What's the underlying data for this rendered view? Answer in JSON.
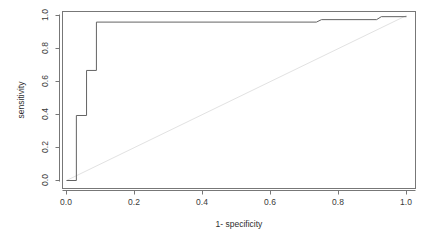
{
  "figure": {
    "kind": "roc-plot",
    "background_color": "#ffffff",
    "frame_color": "#777777",
    "curve_color": "#636363",
    "reference_line_color": "#e2e2e2",
    "tick_label_color": "#3a3a3a"
  },
  "chart_data": {
    "type": "line",
    "title": "",
    "xlabel": "1- specificity",
    "ylabel": "sensitivity",
    "xlim": [
      0.0,
      1.0
    ],
    "ylim": [
      0.0,
      1.0
    ],
    "grid": false,
    "legend": null,
    "xticks": [
      0.0,
      0.2,
      0.4,
      0.6,
      0.8,
      1.0
    ],
    "xtick_labels": [
      "0.0",
      "0.2",
      "0.4",
      "0.6",
      "0.8",
      "1.0"
    ],
    "yticks": [
      0.0,
      0.2,
      0.4,
      0.6,
      0.8,
      1.0
    ],
    "ytick_labels": [
      "0.0",
      "0.2",
      "0.4",
      "0.6",
      "0.8",
      "1.0"
    ],
    "series": [
      {
        "name": "ROC curve",
        "style": "step",
        "color": "#636363",
        "x": [
          0.0,
          0.029,
          0.029,
          0.059,
          0.059,
          0.088,
          0.088,
          0.735,
          0.75,
          0.912,
          0.926,
          1.0
        ],
        "y": [
          0.0,
          0.0,
          0.394,
          0.394,
          0.667,
          0.667,
          0.96,
          0.96,
          0.975,
          0.975,
          0.993,
          0.993
        ]
      },
      {
        "name": "chance reference line",
        "style": "line",
        "color": "#e2e2e2",
        "x": [
          0.0,
          1.0
        ],
        "y": [
          0.0,
          1.0
        ]
      }
    ]
  },
  "axes": {
    "x_axis_label": "1- specificity",
    "y_axis_label": "sensitivity"
  }
}
